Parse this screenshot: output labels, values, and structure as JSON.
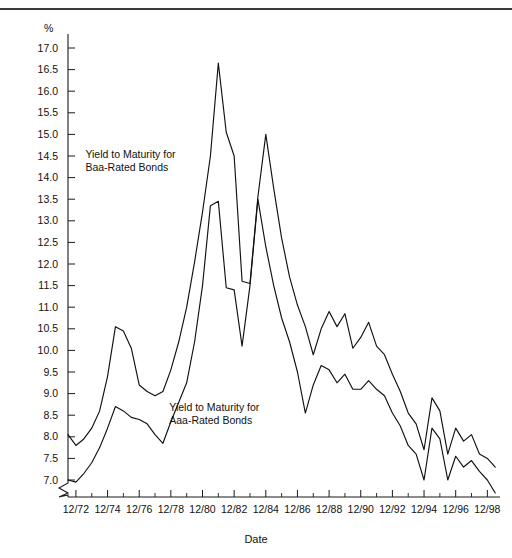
{
  "figure": {
    "unit_label": "%",
    "xaxis_title": "Date"
  },
  "chart_data": {
    "type": "line",
    "title": "",
    "subtitle": "",
    "xlabel": "Date",
    "ylabel": "%",
    "ylim": [
      7.0,
      17.0
    ],
    "y_axis_break_below": 7.0,
    "grid": false,
    "legend_position": "inline-annotations",
    "ytick_labels": [
      "17.0",
      "16.5",
      "16.0",
      "15.5",
      "15.0",
      "14.5",
      "14.0",
      "13.5",
      "13.0",
      "12.5",
      "12.0",
      "11.5",
      "11.0",
      "10.5",
      "10.0",
      "9.5",
      "9.0",
      "8.5",
      "8.0",
      "7.5",
      "7.0"
    ],
    "ytick_values": [
      17.0,
      16.5,
      16.0,
      15.5,
      15.0,
      14.5,
      14.0,
      13.5,
      13.0,
      12.5,
      12.0,
      11.5,
      11.0,
      10.5,
      10.0,
      9.5,
      9.0,
      8.5,
      8.0,
      7.5,
      7.0
    ],
    "xtick_labels": [
      "12/72",
      "12/74",
      "12/76",
      "12/78",
      "12/80",
      "12/82",
      "12/84",
      "12/86",
      "12/88",
      "12/90",
      "12/92",
      "12/94",
      "12/96",
      "12/98"
    ],
    "xtick_values": [
      1972,
      1974,
      1976,
      1978,
      1980,
      1982,
      1984,
      1986,
      1988,
      1990,
      1992,
      1994,
      1996,
      1998
    ],
    "xlim": [
      1971.5,
      1998.8
    ],
    "x": [
      1971.5,
      1972.0,
      1972.5,
      1973.0,
      1973.5,
      1974.0,
      1974.5,
      1975.0,
      1975.5,
      1976.0,
      1976.5,
      1977.0,
      1977.5,
      1978.0,
      1978.5,
      1979.0,
      1979.5,
      1980.0,
      1980.5,
      1981.0,
      1981.5,
      1982.0,
      1982.5,
      1983.0,
      1983.5,
      1984.0,
      1984.5,
      1985.0,
      1985.5,
      1986.0,
      1986.5,
      1987.0,
      1987.5,
      1988.0,
      1988.5,
      1989.0,
      1989.5,
      1990.0,
      1990.5,
      1991.0,
      1991.5,
      1992.0,
      1992.5,
      1993.0,
      1993.5,
      1994.0,
      1994.5,
      1995.0,
      1995.5,
      1996.0,
      1996.5,
      1997.0,
      1997.5,
      1998.0,
      1998.5
    ],
    "series": [
      {
        "name": "Yield to Maturity for Baa-Rated Bonds",
        "annotation": "Yield to Maturity for\nBaa-Rated Bonds",
        "values": [
          8.05,
          7.8,
          7.95,
          8.2,
          8.6,
          9.4,
          10.55,
          10.45,
          10.05,
          9.2,
          9.05,
          8.95,
          9.05,
          9.55,
          10.2,
          11.0,
          12.05,
          13.2,
          14.5,
          16.65,
          15.05,
          14.5,
          11.6,
          11.55,
          13.55,
          15.0,
          13.75,
          12.6,
          11.7,
          11.05,
          10.55,
          9.9,
          10.5,
          10.9,
          10.55,
          10.85,
          10.05,
          10.3,
          10.65,
          10.1,
          9.9,
          9.45,
          9.05,
          8.55,
          8.3,
          7.7,
          8.9,
          8.6,
          7.6,
          8.2,
          7.9,
          8.05,
          7.6,
          7.5,
          7.3
        ],
        "color": "#111111",
        "annotation_x": 1972.6,
        "annotation_y": 14.45
      },
      {
        "name": "Yield to Maturity for Aaa-Rated Bonds",
        "annotation": "Yield to Maturity for\nAaa-Rated Bonds",
        "values": [
          7.0,
          6.95,
          7.15,
          7.4,
          7.75,
          8.2,
          8.7,
          8.6,
          8.45,
          8.4,
          8.3,
          8.05,
          7.85,
          8.35,
          8.8,
          9.25,
          10.2,
          11.5,
          13.35,
          13.45,
          11.45,
          11.4,
          10.1,
          11.5,
          13.5,
          12.4,
          11.5,
          10.75,
          10.2,
          9.5,
          8.55,
          9.2,
          9.65,
          9.55,
          9.25,
          9.45,
          9.1,
          9.1,
          9.3,
          9.1,
          8.95,
          8.55,
          8.25,
          7.8,
          7.6,
          7.0,
          8.2,
          7.95,
          7.0,
          7.55,
          7.3,
          7.45,
          7.2,
          7.0,
          6.7
        ],
        "color": "#111111",
        "annotation_x": 1977.9,
        "annotation_y": 8.6
      }
    ]
  }
}
